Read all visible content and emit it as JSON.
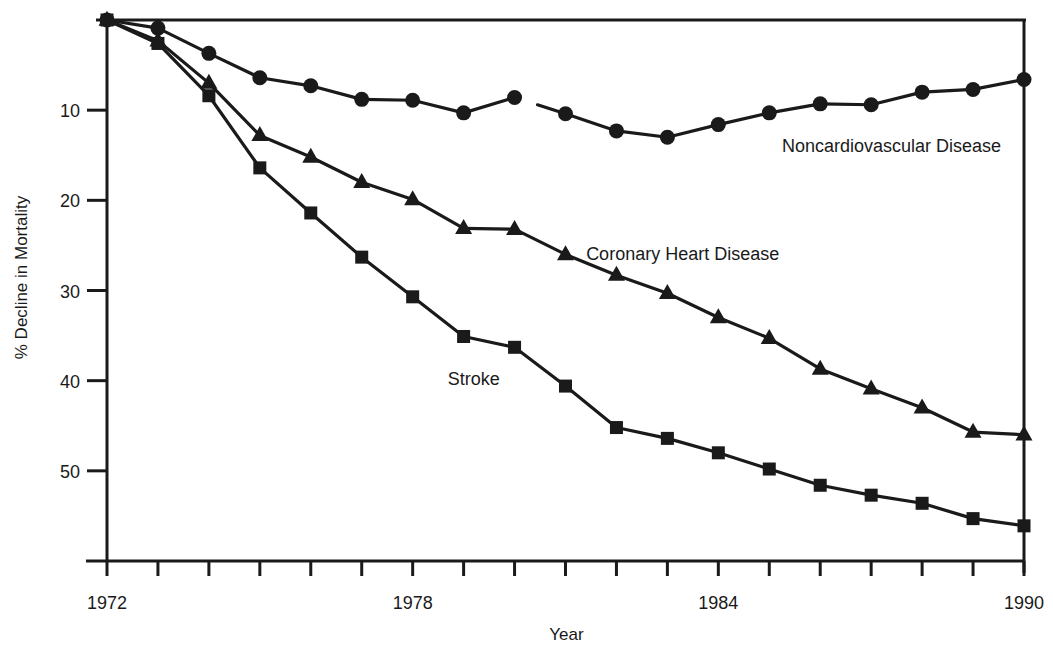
{
  "chart_data": {
    "type": "line",
    "title": "",
    "xlabel": "Year",
    "ylabel": "% Decline in Mortality",
    "xlim": [
      1972,
      1990
    ],
    "ylim": [
      0,
      60
    ],
    "y_inverted": true,
    "grid": false,
    "x": [
      1972,
      1973,
      1974,
      1975,
      1976,
      1977,
      1978,
      1979,
      1980,
      1981,
      1982,
      1983,
      1984,
      1985,
      1986,
      1987,
      1988,
      1989,
      1990
    ],
    "x_tick_labels": [
      "1972",
      "1978",
      "1984",
      "1990"
    ],
    "x_tick_label_values": [
      1972,
      1978,
      1984,
      1990
    ],
    "y_tick_labels": [
      "10",
      "20",
      "30",
      "40",
      "50"
    ],
    "y_tick_label_values": [
      10,
      20,
      30,
      40,
      50
    ],
    "series": [
      {
        "name": "Noncardiovascular Disease",
        "marker": "circle",
        "values": [
          0,
          0.9,
          3.7,
          6.4,
          7.3,
          8.8,
          8.9,
          10.3,
          8.6,
          10.4,
          12.3,
          13.0,
          11.6,
          10.3,
          9.3,
          9.4,
          8.0,
          7.7,
          6.6
        ],
        "gap_after_index": 8
      },
      {
        "name": "Coronary Heart Disease",
        "marker": "triangle",
        "values": [
          0,
          2.3,
          7.0,
          12.8,
          15.2,
          18.0,
          19.9,
          23.1,
          23.2,
          26.0,
          28.3,
          30.3,
          33.0,
          35.3,
          38.7,
          40.9,
          43.0,
          45.7,
          46.0
        ]
      },
      {
        "name": "Stroke",
        "marker": "square",
        "values": [
          0,
          2.6,
          8.4,
          16.4,
          21.4,
          26.3,
          30.7,
          35.1,
          36.3,
          40.6,
          45.2,
          46.4,
          48.0,
          49.8,
          51.6,
          52.7,
          53.6,
          55.3,
          56.1
        ]
      }
    ],
    "annotations": [
      {
        "text": "Noncardiovascular Disease",
        "series": "Noncardiovascular Disease",
        "x": 1987.4,
        "y": 14.6
      },
      {
        "text": "Coronary Heart Disease",
        "series": "Coronary Heart Disease",
        "x": 1983.3,
        "y": 26.6
      },
      {
        "text": "Stroke",
        "series": "Stroke",
        "x": 1979.2,
        "y": 40.5
      }
    ]
  }
}
